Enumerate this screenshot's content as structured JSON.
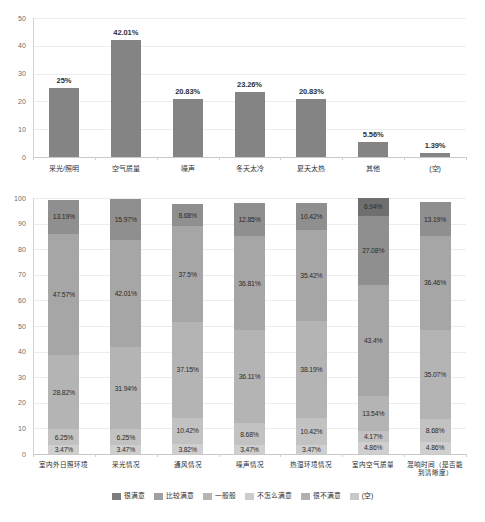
{
  "chart_data": [
    {
      "type": "bar",
      "title": "",
      "xlabel": "",
      "ylabel": "",
      "ylim": [
        0,
        50
      ],
      "yticks": [
        0,
        10,
        20,
        30,
        40,
        50
      ],
      "grid": true,
      "legend": "none",
      "series_color": "#848484",
      "categories": [
        "采光/照明",
        "空气质量",
        "噪声",
        "冬天太冷",
        "夏天太热",
        "其他",
        "(空)"
      ],
      "values": [
        25,
        42.01,
        20.83,
        23.26,
        20.83,
        5.56,
        1.39
      ],
      "data_labels": [
        "25%",
        "42.01%",
        "20.83%",
        "23.26%",
        "20.83%",
        "5.56%",
        "1.39%"
      ]
    },
    {
      "type": "bar",
      "stacked": true,
      "title": "",
      "xlabel": "",
      "ylabel": "",
      "ylim": [
        0,
        100
      ],
      "yticks": [
        0,
        10,
        20,
        30,
        40,
        50,
        60,
        70,
        80,
        90,
        100
      ],
      "grid": true,
      "legend": "bottom",
      "categories": [
        "室内外日照环境",
        "采光情况",
        "通风情况",
        "噪声情况",
        "热湿环境情况",
        "室内空气质量",
        "混响时间（是否能\n到清晰度）"
      ],
      "series": [
        {
          "name": "很满意",
          "color": "#cfcfcf",
          "values": [
            3.47,
            3.47,
            3.82,
            3.47,
            3.47,
            4.86,
            4.86
          ],
          "labels": [
            "3.47%",
            "3.47%",
            "3.82%",
            "3.47%",
            "3.47%",
            "4.86%",
            "4.86%"
          ]
        },
        {
          "name": "比较满意",
          "color": "#c2c2c2",
          "values": [
            6.25,
            6.25,
            10.42,
            8.68,
            10.42,
            4.17,
            8.68
          ],
          "labels": [
            "6.25%",
            "6.25%",
            "10.42%",
            "8.68%",
            "10.42%",
            "4.17%",
            "8.68%"
          ]
        },
        {
          "name": "一般般",
          "color": "#b4b4b4",
          "values": [
            28.82,
            31.94,
            37.15,
            36.11,
            38.19,
            13.54,
            35.07
          ],
          "labels": [
            "28.82%",
            "31.94%",
            "37.15%",
            "36.11%",
            "38.19%",
            "13.54%",
            "35.07%"
          ]
        },
        {
          "name": "不怎么满意",
          "color": "#a6a6a6",
          "values": [
            47.57,
            42.01,
            37.5,
            36.81,
            35.42,
            43.4,
            36.46
          ],
          "labels": [
            "47.57%",
            "42.01%",
            "37.5%",
            "36.81%",
            "35.42%",
            "43.4%",
            "36.46%"
          ]
        },
        {
          "name": "很不满意",
          "color": "#8f8f8f",
          "values": [
            13.19,
            15.97,
            8.68,
            12.85,
            10.42,
            27.08,
            13.19
          ],
          "labels": [
            "13.19%",
            "15.97%",
            "8.68%",
            "12.85%",
            "10.42%",
            "27.08%",
            "13.19%"
          ]
        },
        {
          "name": "(空)",
          "color": "#6f6f6f",
          "values": [
            0,
            0,
            0,
            0,
            0,
            6.94,
            0
          ],
          "labels": [
            "",
            "",
            "",
            "",
            "",
            "6.94%",
            ""
          ]
        }
      ]
    }
  ],
  "legend": {
    "items": [
      {
        "label": "很满意",
        "color": "#7d7d7d"
      },
      {
        "label": "比较满意",
        "color": "#a0a0a0"
      },
      {
        "label": "一般般",
        "color": "#b5b5b5"
      },
      {
        "label": "不怎么满意",
        "color": "#cccccc"
      },
      {
        "label": "很不满意",
        "color": "#b0b0b0"
      },
      {
        "label": "(空)",
        "color": "#c8c8c8"
      }
    ]
  }
}
